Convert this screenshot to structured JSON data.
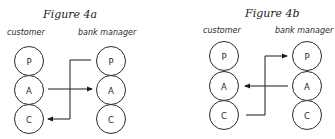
{
  "figures": [
    {
      "title": "Figure 4a",
      "left_label": "customer",
      "right_label": "bank manager",
      "left_nodes": [
        "P",
        "A",
        "C"
      ],
      "right_nodes": [
        "P",
        "A",
        "C"
      ],
      "arrows": [
        {
          "from": "customer.A",
          "to": "bank manager.A"
        },
        {
          "from": "bank manager.P",
          "to": "customer.C"
        }
      ]
    },
    {
      "title": "Figure 4b",
      "left_label": "customer",
      "right_label": "bank manager",
      "left_nodes": [
        "P",
        "A",
        "C"
      ],
      "right_nodes": [
        "P",
        "A",
        "C"
      ],
      "arrows": [
        {
          "from": "bank manager.A",
          "to": "customer.A"
        },
        {
          "from": "customer.C",
          "to": "bank manager.P"
        }
      ]
    }
  ],
  "colors": {
    "stroke": "#2a2a2a",
    "background": "#ffffff"
  }
}
